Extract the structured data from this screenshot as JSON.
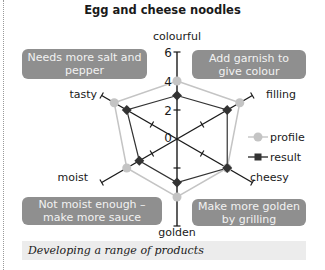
{
  "title": "Egg and cheese noodles",
  "caption": "Developing a range of products",
  "notes": [
    {
      "id": "tasty-note",
      "text": "Needs more salt and pepper"
    },
    {
      "id": "colour-note",
      "text": "Add garnish to give colour"
    },
    {
      "id": "moist-note",
      "text": "Not moist enough – make more sauce"
    },
    {
      "id": "golden-note",
      "text": "Make more golden by grilling"
    }
  ],
  "colors": {
    "profile": "#c4c4c4",
    "result": "#333333",
    "axis": "#1a1a1a",
    "note_bg": "#8f8f8f",
    "caption_bg": "#ececec"
  },
  "chart_data": {
    "type": "radar",
    "title": "Egg and cheese noodles",
    "axes": [
      "colourful",
      "filling",
      "cheesy",
      "golden",
      "moist",
      "tasty"
    ],
    "range": [
      0,
      6
    ],
    "tick_labels": [
      "0",
      "2",
      "4",
      "6"
    ],
    "series": [
      {
        "name": "profile",
        "marker": "circle",
        "values": [
          4,
          5,
          4,
          4,
          4,
          5
        ]
      },
      {
        "name": "result",
        "marker": "square",
        "values": [
          3,
          4,
          4,
          3,
          3,
          4
        ]
      }
    ],
    "legend": [
      "profile",
      "result"
    ],
    "legend_position": "right"
  }
}
